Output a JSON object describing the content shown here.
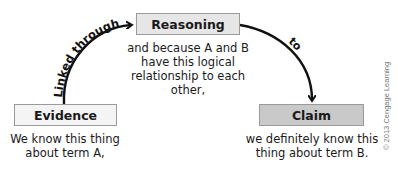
{
  "diagram": {
    "nodes": {
      "evidence": {
        "label": "Evidence",
        "description": "We know this thing about term A,",
        "desc_lines": [
          "We know this thing",
          "about term A,"
        ],
        "fill": "#f4f4f4"
      },
      "reasoning": {
        "label": "Reasoning",
        "description": "and because A and B have this logical relationship to each other,",
        "desc_lines": [
          "and because A and B",
          "have this logical",
          "relationship to each other,"
        ],
        "fill": "#e6e6e6"
      },
      "claim": {
        "label": "Claim",
        "description": "we definitely know this thing about term B.",
        "desc_lines": [
          "we definitely know this",
          "thing about term B."
        ],
        "fill": "#c9c9c9"
      }
    },
    "edges": [
      {
        "from": "evidence",
        "to": "reasoning",
        "label": "Linked through"
      },
      {
        "from": "reasoning",
        "to": "claim",
        "label": "to"
      }
    ],
    "copyright": "© 2013 Cengage Learning"
  }
}
